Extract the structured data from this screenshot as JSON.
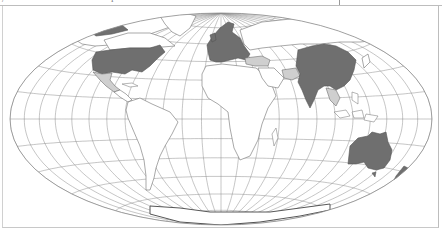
{
  "map": {
    "projection": "Hammer / Mollweide (equal-area, elliptical)",
    "style": "grayscale",
    "graticule": {
      "visible": true,
      "meridian_step_deg": 15,
      "parallel_step_deg": 15
    },
    "header_text_fragments": [
      "/",
      "i"
    ],
    "legend": null,
    "colors": {
      "background": "#ffffff",
      "graticule": "#8c8c8c",
      "land_outline": "#6e6e6e",
      "highlight_dark": "#6f6f6f",
      "highlight_light": "#cfcfcf",
      "frame": "#c4c4c4"
    },
    "highlighted_dark": [
      "United States",
      "Western & Central Europe",
      "Scandinavia",
      "China",
      "Mongolia",
      "India",
      "Myanmar",
      "Australia"
    ],
    "highlighted_light": [
      "Mexico",
      "Turkey / Middle East",
      "Iran / Pakistan",
      "Thailand / Southeast Asia"
    ]
  }
}
